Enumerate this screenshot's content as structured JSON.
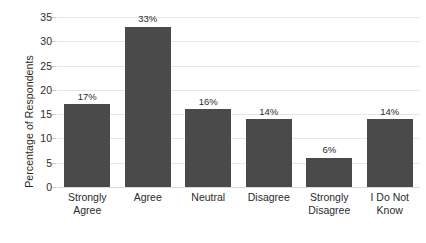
{
  "chart_data": {
    "type": "bar",
    "title": "",
    "subtitle": "",
    "xlabel": "",
    "ylabel": "Percentage of Respondents",
    "categories": [
      "Strongly Agree",
      "Agree",
      "Neutral",
      "Disagree",
      "Strongly Disagree",
      "I Do Not Know"
    ],
    "category_lines": [
      [
        "Strongly",
        "Agree"
      ],
      [
        "Agree",
        ""
      ],
      [
        "Neutral",
        ""
      ],
      [
        "Disagree",
        ""
      ],
      [
        "Strongly",
        "Disagree"
      ],
      [
        "I Do Not",
        "Know"
      ]
    ],
    "values": [
      17,
      33,
      16,
      14,
      6,
      14
    ],
    "data_labels": [
      "17%",
      "33%",
      "16%",
      "14%",
      "6%",
      "14%"
    ],
    "ylim": [
      0,
      35
    ],
    "y_ticks": [
      0,
      5,
      10,
      15,
      20,
      25,
      30,
      35
    ],
    "y_tick_labels": [
      "0",
      "5",
      "10",
      "15",
      "20",
      "25",
      "30",
      "35"
    ],
    "grid": true,
    "grid_axis": "y",
    "legend": false,
    "legend_position": "none",
    "bar_color": "#4a4a4a",
    "gridline_color": "#e6e6e6",
    "background_color": "#ffffff",
    "text_color": "#2b2b2b"
  }
}
